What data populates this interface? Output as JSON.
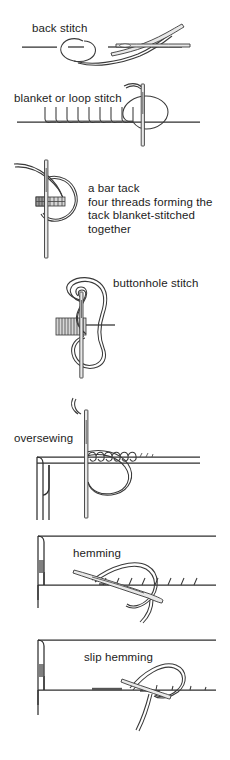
{
  "page": {
    "background_color": "#ffffff",
    "ink_color": "#333333",
    "text_color": "#1c1c1c",
    "width": 230,
    "height": 760
  },
  "figures": [
    {
      "id": "back-stitch",
      "label": "back stitch",
      "label_x": 32,
      "label_y": 22,
      "description": "A needle and thread forming a back stitch along a horizontal fabric line, with a looped thread on the left and the needle crossing the line on the right."
    },
    {
      "id": "blanket-or-loop-stitch",
      "label": "blanket or loop stitch",
      "label_x": 14,
      "label_y": 92,
      "description": "A row of vertical looped blanket stitches along a horizontal fabric edge with a needle entering at the right and a thread loop around it."
    },
    {
      "id": "bar-tack",
      "label": "a bar tack\nfour threads forming the\ntack blanket-stitched\ntogether",
      "label_lines": [
        "a bar tack",
        "four threads forming the",
        "tack blanket-stitched",
        "together"
      ],
      "label_x": 88,
      "label_y": 182,
      "description": "A vertical needle passing through a short horizontal bar of four bundled threads, wrapped with close blanket stitching, with a thread loop curving to the right."
    },
    {
      "id": "buttonhole-stitch",
      "label": "buttonhole stitch",
      "label_x": 113,
      "label_y": 277,
      "description": "A vertical needle through a hatched bar at left with a double thread loop looping over and under the needle forming the buttonhole knot."
    },
    {
      "id": "oversewing",
      "label": "oversewing",
      "label_x": 14,
      "label_y": 432,
      "description": "Two folded fabric edges butted together seen in section, with a needle passing down through them and a row of slanting oversewing stitches across the join."
    },
    {
      "id": "hemming",
      "label": "hemming",
      "label_x": 73,
      "label_y": 547,
      "description": "A folded hem edge in section with a needle taking slanted hemming stitches through the fold and the single fabric layer, thread looping above."
    },
    {
      "id": "slip-hemming",
      "label": "slip hemming",
      "label_x": 84,
      "label_y": 651,
      "description": "A folded hem edge in section with the needle slipping through the fold so stitches are nearly invisible, thread looping above the hem line."
    }
  ]
}
